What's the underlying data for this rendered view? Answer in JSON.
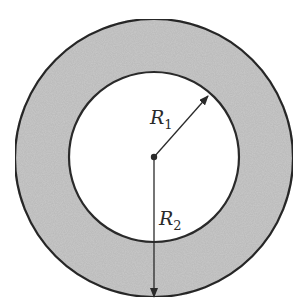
{
  "figure": {
    "type": "annulus",
    "colors": {
      "ring_fill": "#c9c9c9",
      "inner_fill": "#ffffff",
      "stroke": "#2a2a2a"
    },
    "labels": {
      "inner_radius": {
        "main": "R",
        "subscript": "1"
      },
      "outer_radius": {
        "main": "R",
        "subscript": "2"
      }
    }
  }
}
